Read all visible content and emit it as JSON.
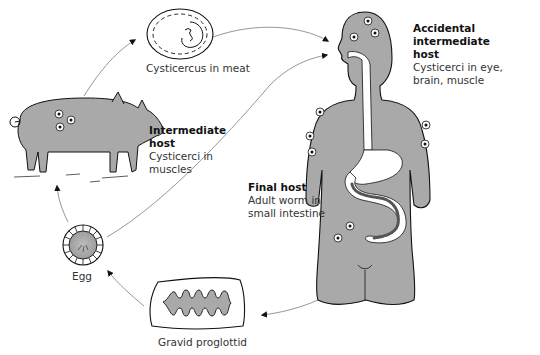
{
  "diagram": {
    "colors": {
      "fill_gray": "#a9a9a9",
      "outline": "#1a1a1a",
      "arrow": "#888888",
      "background": "#ffffff"
    },
    "stages": {
      "cysticercus": {
        "caption": "Cysticercus in meat"
      },
      "intermediate_host": {
        "title": "Intermediate host",
        "title_line1": "Intermediate",
        "title_line2": "host",
        "desc_line1": "Cysticerci in",
        "desc_line2": "muscles"
      },
      "accidental_host": {
        "title_line1": "Accidental intermediate",
        "title_line2": "host",
        "desc_line1": "Cysticerci in eye,",
        "desc_line2": "brain, muscle"
      },
      "final_host": {
        "title": "Final host",
        "desc_line1": "Adult worm in",
        "desc_line2": "small intestine"
      },
      "egg": {
        "caption": "Egg"
      },
      "proglottid": {
        "caption": "Gravid proglottid"
      }
    },
    "arrows": [
      {
        "from": "pig",
        "to": "cysticercus"
      },
      {
        "from": "cysticercus",
        "to": "human-mouth"
      },
      {
        "from": "egg",
        "to": "human-mouth"
      },
      {
        "from": "human",
        "to": "proglottid"
      },
      {
        "from": "proglottid",
        "to": "egg"
      },
      {
        "from": "egg",
        "to": "pig"
      }
    ]
  }
}
